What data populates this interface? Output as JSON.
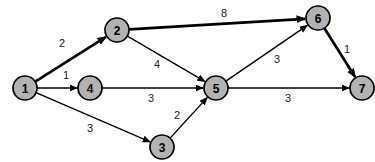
{
  "figure": {
    "type": "directed-weighted-graph",
    "background": "#ffffff"
  },
  "graph": {
    "node_fill": "#b2b2b2",
    "node_stroke": "#000000",
    "node_stroke_width": 1.7,
    "node_radius": 12,
    "edge_color": "#000000",
    "edge_width_normal": 1.4,
    "edge_width_bold": 2.7,
    "label_color": "#1a1a1a",
    "nodes": [
      {
        "id": "1",
        "x": 25,
        "y": 88
      },
      {
        "id": "2",
        "x": 117,
        "y": 30
      },
      {
        "id": "3",
        "x": 162,
        "y": 147
      },
      {
        "id": "4",
        "x": 90,
        "y": 88
      },
      {
        "id": "5",
        "x": 216,
        "y": 88
      },
      {
        "id": "6",
        "x": 318,
        "y": 18
      },
      {
        "id": "7",
        "x": 362,
        "y": 88
      }
    ],
    "edges": [
      {
        "from": "1",
        "to": "2",
        "weight": "2",
        "bold": true,
        "label_x": 62,
        "label_y": 43
      },
      {
        "from": "1",
        "to": "4",
        "weight": "1",
        "bold": false,
        "label_x": 66,
        "label_y": 75
      },
      {
        "from": "1",
        "to": "3",
        "weight": "3",
        "bold": false,
        "label_x": 90,
        "label_y": 128
      },
      {
        "from": "2",
        "to": "6",
        "weight": "8",
        "bold": true,
        "label_x": 224,
        "label_y": 13
      },
      {
        "from": "2",
        "to": "5",
        "weight": "4",
        "bold": false,
        "label_x": 157,
        "label_y": 64
      },
      {
        "from": "4",
        "to": "5",
        "weight": "3",
        "bold": false,
        "label_x": 151,
        "label_y": 98
      },
      {
        "from": "3",
        "to": "5",
        "weight": "2",
        "bold": false,
        "label_x": 177,
        "label_y": 115
      },
      {
        "from": "5",
        "to": "6",
        "weight": "3",
        "bold": false,
        "label_x": 277,
        "label_y": 59
      },
      {
        "from": "5",
        "to": "7",
        "weight": "3",
        "bold": false,
        "label_x": 288,
        "label_y": 98
      },
      {
        "from": "6",
        "to": "7",
        "weight": "1",
        "bold": true,
        "label_x": 347,
        "label_y": 49
      }
    ]
  }
}
